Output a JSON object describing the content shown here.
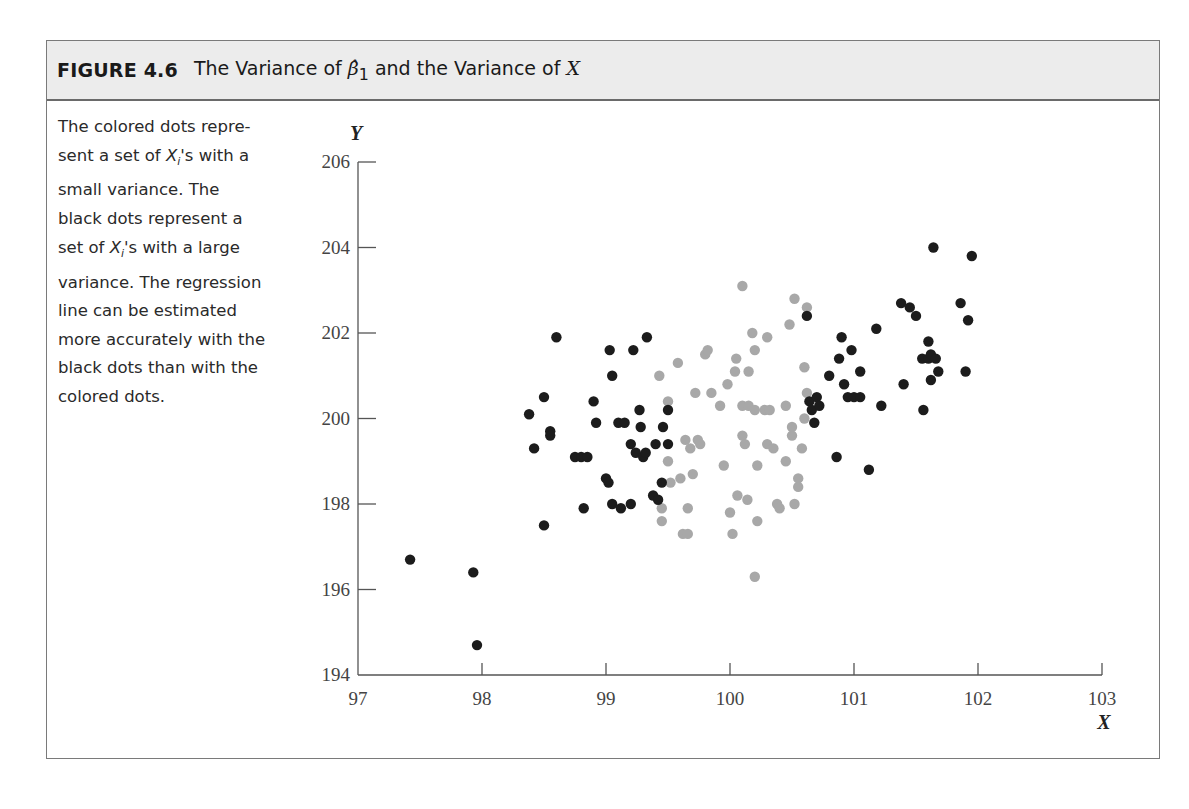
{
  "figure": {
    "label": "FIGURE 4.6",
    "title_pre": "The Variance of ",
    "title_beta": "β̂",
    "title_sub": "1",
    "title_mid": " and the Variance of ",
    "title_x": "X"
  },
  "caption": {
    "lines": [
      "The colored dots repre-",
      "sent a set of X_i's with a",
      "small variance. The",
      "black dots represent a",
      "set of X_i's with a large",
      "variance. The regression",
      "line can be estimated",
      "more accurately with the",
      "black dots than with the",
      "colored dots."
    ],
    "text": "The colored dots represent a set of Xi's with a small variance. The black dots represent a set of Xi's with a large variance. The regression line can be estimated more accurately with the black dots than with the colored dots."
  },
  "colors": {
    "black_dots": "#1c1c1c",
    "colored_dots": "#a8a8a8",
    "header_bg": "#ececec",
    "frame": "#7a7a7a"
  },
  "chart_data": {
    "type": "scatter",
    "title": "The Variance of β̂1 and the Variance of X",
    "xlabel": "X",
    "ylabel": "Y",
    "xlim": [
      97,
      103
    ],
    "ylim": [
      194,
      206
    ],
    "xticks": [
      97,
      98,
      99,
      100,
      101,
      102,
      103
    ],
    "yticks": [
      194,
      196,
      198,
      200,
      202,
      204,
      206
    ],
    "grid": false,
    "legend": null,
    "series": [
      {
        "name": "Large variance X (black dots)",
        "color": "#1c1c1c",
        "points": [
          [
            97.42,
            196.7
          ],
          [
            97.93,
            196.4
          ],
          [
            97.96,
            194.7
          ],
          [
            98.38,
            200.1
          ],
          [
            98.42,
            199.3
          ],
          [
            98.5,
            197.5
          ],
          [
            98.5,
            200.5
          ],
          [
            98.55,
            199.7
          ],
          [
            98.55,
            199.6
          ],
          [
            98.6,
            201.9
          ],
          [
            98.75,
            199.1
          ],
          [
            98.8,
            199.1
          ],
          [
            98.82,
            197.9
          ],
          [
            98.85,
            199.1
          ],
          [
            98.9,
            200.4
          ],
          [
            98.92,
            199.9
          ],
          [
            99.0,
            198.6
          ],
          [
            99.02,
            198.5
          ],
          [
            99.03,
            201.6
          ],
          [
            99.05,
            201.0
          ],
          [
            99.05,
            198.0
          ],
          [
            99.1,
            199.9
          ],
          [
            99.12,
            197.9
          ],
          [
            99.15,
            199.9
          ],
          [
            99.2,
            199.4
          ],
          [
            99.2,
            198.0
          ],
          [
            99.22,
            201.6
          ],
          [
            99.24,
            199.2
          ],
          [
            99.27,
            200.2
          ],
          [
            99.28,
            199.8
          ],
          [
            99.3,
            199.1
          ],
          [
            99.32,
            199.2
          ],
          [
            99.33,
            201.9
          ],
          [
            99.38,
            198.2
          ],
          [
            99.4,
            199.4
          ],
          [
            99.42,
            198.1
          ],
          [
            99.45,
            198.5
          ],
          [
            99.46,
            199.8
          ],
          [
            99.5,
            199.4
          ],
          [
            99.5,
            200.2
          ],
          [
            100.62,
            202.4
          ],
          [
            100.64,
            200.4
          ],
          [
            100.66,
            200.2
          ],
          [
            100.68,
            199.9
          ],
          [
            100.7,
            200.5
          ],
          [
            100.72,
            200.3
          ],
          [
            100.8,
            201.0
          ],
          [
            100.86,
            199.1
          ],
          [
            100.88,
            201.4
          ],
          [
            100.9,
            201.9
          ],
          [
            100.92,
            200.8
          ],
          [
            100.95,
            200.5
          ],
          [
            100.98,
            201.6
          ],
          [
            101.0,
            200.5
          ],
          [
            101.05,
            201.1
          ],
          [
            101.05,
            200.5
          ],
          [
            101.12,
            198.8
          ],
          [
            101.18,
            202.1
          ],
          [
            101.22,
            200.3
          ],
          [
            101.38,
            202.7
          ],
          [
            101.4,
            200.8
          ],
          [
            101.45,
            202.6
          ],
          [
            101.5,
            202.4
          ],
          [
            101.55,
            201.4
          ],
          [
            101.56,
            200.2
          ],
          [
            101.6,
            201.4
          ],
          [
            101.6,
            201.8
          ],
          [
            101.62,
            201.5
          ],
          [
            101.62,
            200.9
          ],
          [
            101.64,
            204.0
          ],
          [
            101.66,
            201.4
          ],
          [
            101.68,
            201.1
          ],
          [
            101.86,
            202.7
          ],
          [
            101.9,
            201.1
          ],
          [
            101.92,
            202.3
          ],
          [
            101.95,
            203.8
          ]
        ]
      },
      {
        "name": "Small variance X (colored dots)",
        "color": "#a8a8a8",
        "points": [
          [
            99.43,
            201.0
          ],
          [
            99.45,
            197.9
          ],
          [
            99.45,
            197.6
          ],
          [
            99.5,
            200.4
          ],
          [
            99.5,
            199.0
          ],
          [
            99.52,
            198.5
          ],
          [
            99.58,
            201.3
          ],
          [
            99.6,
            198.6
          ],
          [
            99.62,
            197.3
          ],
          [
            99.64,
            199.5
          ],
          [
            99.66,
            197.9
          ],
          [
            99.66,
            197.3
          ],
          [
            99.68,
            199.3
          ],
          [
            99.7,
            198.7
          ],
          [
            99.72,
            200.6
          ],
          [
            99.74,
            199.5
          ],
          [
            99.76,
            199.4
          ],
          [
            99.8,
            201.5
          ],
          [
            99.82,
            201.6
          ],
          [
            99.85,
            200.6
          ],
          [
            99.92,
            200.3
          ],
          [
            99.95,
            198.9
          ],
          [
            99.98,
            200.8
          ],
          [
            100.0,
            197.8
          ],
          [
            100.02,
            197.3
          ],
          [
            100.04,
            201.1
          ],
          [
            100.05,
            201.4
          ],
          [
            100.06,
            198.2
          ],
          [
            100.1,
            203.1
          ],
          [
            100.1,
            200.3
          ],
          [
            100.1,
            199.6
          ],
          [
            100.12,
            199.4
          ],
          [
            100.14,
            198.1
          ],
          [
            100.15,
            201.1
          ],
          [
            100.15,
            200.3
          ],
          [
            100.18,
            202.0
          ],
          [
            100.2,
            201.6
          ],
          [
            100.2,
            200.2
          ],
          [
            100.2,
            196.3
          ],
          [
            100.22,
            198.9
          ],
          [
            100.22,
            197.6
          ],
          [
            100.28,
            200.2
          ],
          [
            100.3,
            201.9
          ],
          [
            100.3,
            199.4
          ],
          [
            100.32,
            200.2
          ],
          [
            100.35,
            199.3
          ],
          [
            100.38,
            198.0
          ],
          [
            100.4,
            197.9
          ],
          [
            100.45,
            200.3
          ],
          [
            100.45,
            199.0
          ],
          [
            100.48,
            202.2
          ],
          [
            100.5,
            199.8
          ],
          [
            100.5,
            199.6
          ],
          [
            100.52,
            202.8
          ],
          [
            100.52,
            198.0
          ],
          [
            100.55,
            198.6
          ],
          [
            100.55,
            198.4
          ],
          [
            100.58,
            199.3
          ],
          [
            100.6,
            200.0
          ],
          [
            100.6,
            201.2
          ],
          [
            100.62,
            200.6
          ],
          [
            100.62,
            202.6
          ]
        ]
      }
    ]
  }
}
